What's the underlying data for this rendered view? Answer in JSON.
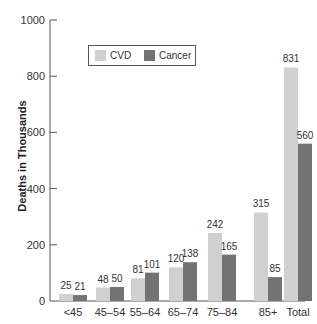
{
  "chart_data": {
    "type": "bar",
    "title": "",
    "xlabel": "",
    "ylabel": "Deaths in Thousands",
    "ylim": [
      0,
      1000
    ],
    "yticks": [
      0,
      200,
      400,
      600,
      800,
      1000
    ],
    "grid": false,
    "legend_position": "upper-left inside",
    "categories": [
      "<45",
      "45–54",
      "55–64",
      "65–74",
      "75–84",
      "85+",
      "Total"
    ],
    "series": [
      {
        "name": "CVD",
        "color": "#d0d0d0",
        "values": [
          25,
          48,
          81,
          120,
          242,
          315,
          831
        ]
      },
      {
        "name": "Cancer",
        "color": "#737373",
        "values": [
          21,
          50,
          101,
          138,
          165,
          85,
          560
        ]
      }
    ],
    "data_labels": true
  },
  "legend": {
    "items": [
      {
        "label": "CVD",
        "color": "#d0d0d0"
      },
      {
        "label": "Cancer",
        "color": "#737373"
      }
    ]
  },
  "axis": {
    "ylabel": "Deaths in Thousands"
  }
}
